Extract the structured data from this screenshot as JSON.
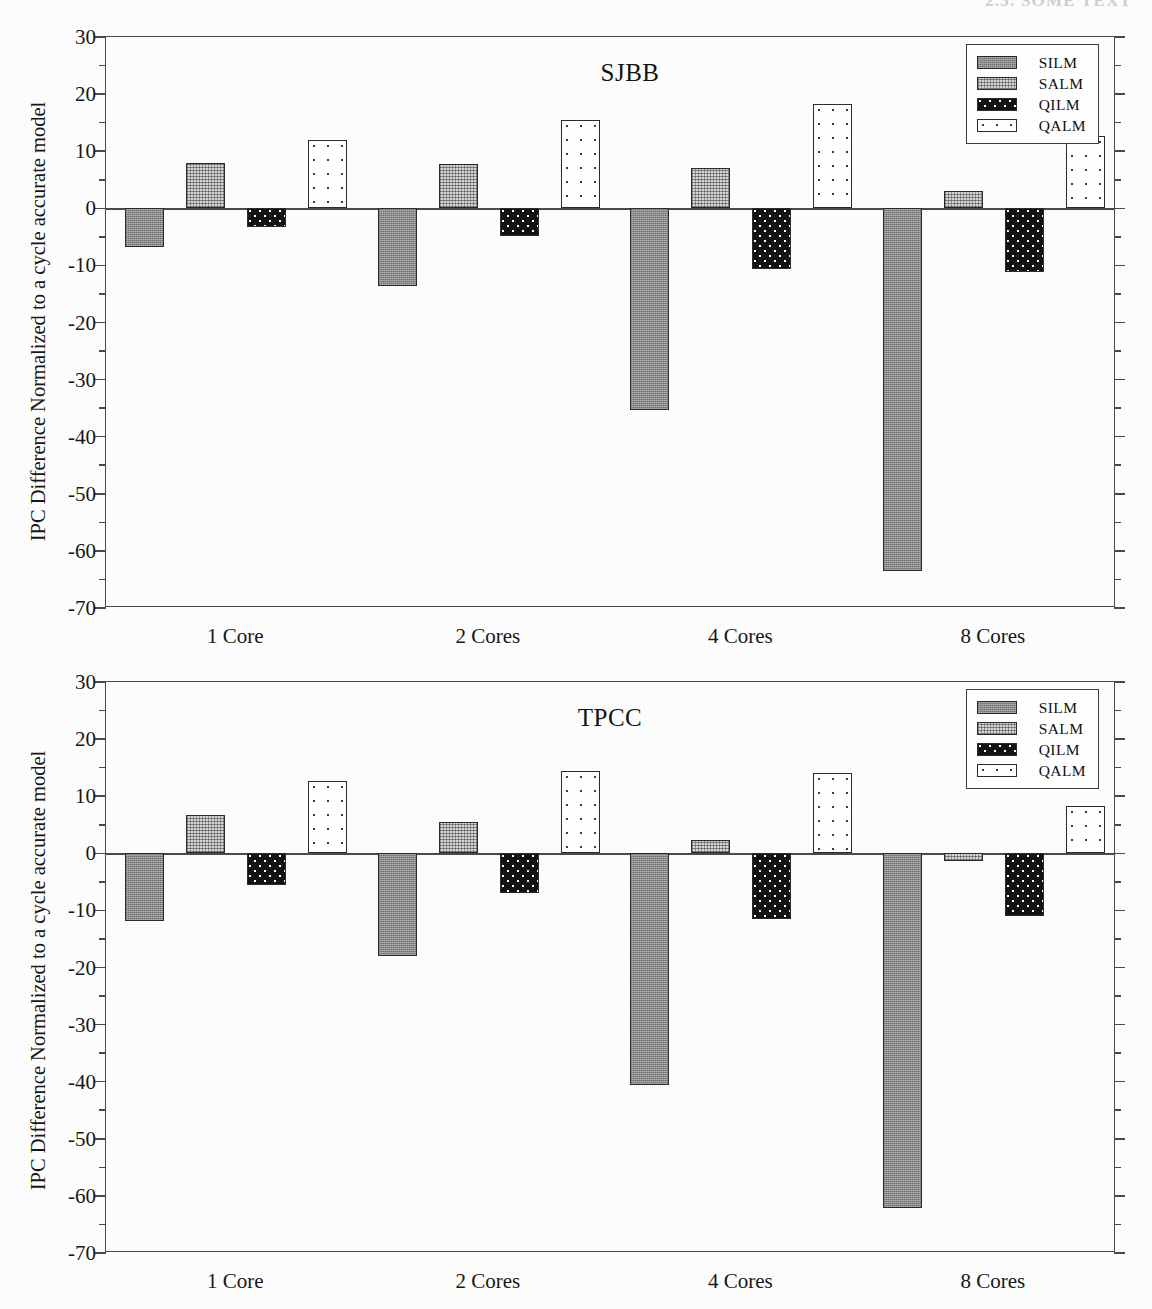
{
  "page": {
    "header_text": "2.3.  SOME  TEXT"
  },
  "common": {
    "ylabel": "IPC Difference Normalized to a cycle accurate model",
    "categories": [
      "1 Core",
      "2 Cores",
      "4 Cores",
      "8 Cores"
    ],
    "series_names": [
      "SILM",
      "SALM",
      "QILM",
      "QALM"
    ],
    "ytick_labels": [
      "30",
      "20",
      "10",
      "0",
      "-10",
      "-20",
      "-30",
      "-40",
      "-50",
      "-60",
      "-70"
    ],
    "ytick_values": [
      30,
      20,
      10,
      0,
      -10,
      -20,
      -30,
      -40,
      -50,
      -60,
      -70
    ],
    "yminor_values": [
      25,
      15,
      5,
      -5,
      -15,
      -25,
      -35,
      -45,
      -55,
      -65
    ],
    "ylim": [
      -70,
      30
    ]
  },
  "chart_data": [
    {
      "type": "bar",
      "title": "SJBB",
      "xlabel": "",
      "ylabel": "IPC Difference Normalized to a cycle accurate model",
      "ylim": [
        -70,
        30
      ],
      "grid": false,
      "legend_position": "top-right",
      "categories": [
        "1 Core",
        "2 Cores",
        "4 Cores",
        "8 Cores"
      ],
      "series": [
        {
          "name": "SILM",
          "values": [
            -6.8,
            -13.6,
            -35.3,
            -63.5
          ]
        },
        {
          "name": "SALM",
          "values": [
            8.0,
            7.8,
            7.1,
            3.0
          ]
        },
        {
          "name": "QILM",
          "values": [
            -3.2,
            -4.8,
            -10.6,
            -11.2
          ]
        },
        {
          "name": "QALM",
          "values": [
            11.9,
            15.4,
            18.3,
            12.7
          ]
        }
      ]
    },
    {
      "type": "bar",
      "title": "TPCC",
      "xlabel": "",
      "ylabel": "IPC Difference Normalized to a cycle accurate model",
      "ylim": [
        -70,
        30
      ],
      "grid": false,
      "legend_position": "top-right",
      "categories": [
        "1 Core",
        "2 Cores",
        "4 Cores",
        "8 Cores"
      ],
      "series": [
        {
          "name": "SILM",
          "values": [
            -11.9,
            -18.0,
            -40.6,
            -62.2
          ]
        },
        {
          "name": "SALM",
          "values": [
            6.7,
            5.5,
            2.3,
            -1.3
          ]
        },
        {
          "name": "QILM",
          "values": [
            -5.5,
            -6.9,
            -11.5,
            -10.9
          ]
        },
        {
          "name": "QALM",
          "values": [
            12.7,
            14.4,
            14.1,
            8.2
          ]
        }
      ]
    }
  ]
}
